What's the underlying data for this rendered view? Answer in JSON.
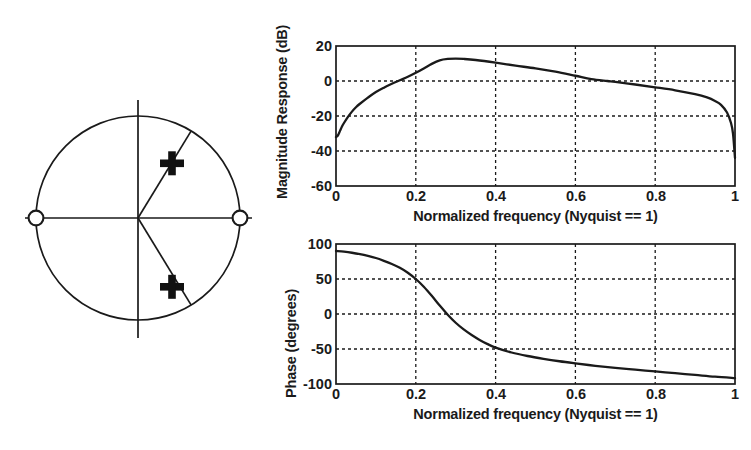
{
  "figure": {
    "panels": [
      "pole-zero-plot",
      "magnitude-response-plot",
      "phase-response-plot"
    ]
  },
  "pole_zero": {
    "unit_circle_label": "unit-circle",
    "zeros_marker": "open-circle",
    "poles_marker": "plus-cross",
    "zeros": [
      {
        "re": -1.0,
        "im": 0.0
      },
      {
        "re": 1.0,
        "im": 0.0
      }
    ],
    "poles": [
      {
        "re": 0.33,
        "im": 0.54,
        "radius": 0.63,
        "angle_deg": 58.5
      },
      {
        "re": 0.33,
        "im": -0.54,
        "radius": 0.63,
        "angle_deg": -58.5
      }
    ]
  },
  "chart_data": [
    {
      "type": "line",
      "name": "magnitude-response",
      "title": "",
      "xlabel": "Normalized frequency (Nyquist == 1)",
      "ylabel": "Magnitude Response (dB)",
      "xlim": [
        0,
        1
      ],
      "ylim": [
        -60,
        20
      ],
      "xticks": [
        0,
        0.2,
        0.4,
        0.6,
        0.8,
        1
      ],
      "xtick_labels": [
        "0",
        "0.2",
        "0.4",
        "0.6",
        "0.8",
        "1"
      ],
      "yticks": [
        -60,
        -40,
        -20,
        0,
        20
      ],
      "ytick_labels": [
        "-60",
        "-40",
        "-20",
        "0",
        "20"
      ],
      "grid": true,
      "grid_style": "dotted",
      "x": [
        0.0,
        0.005,
        0.01,
        0.015,
        0.02,
        0.03,
        0.04,
        0.05,
        0.06,
        0.08,
        0.1,
        0.12,
        0.14,
        0.16,
        0.18,
        0.2,
        0.22,
        0.24,
        0.26,
        0.28,
        0.3,
        0.32,
        0.35,
        0.4,
        0.45,
        0.5,
        0.55,
        0.6,
        0.64,
        0.68,
        0.7,
        0.75,
        0.8,
        0.85,
        0.9,
        0.93,
        0.95,
        0.965,
        0.98,
        0.99,
        0.995,
        1.0
      ],
      "values": [
        -32.0,
        -31.0,
        -28.5,
        -26.0,
        -24.0,
        -20.5,
        -17.5,
        -15.0,
        -13.0,
        -9.5,
        -6.3,
        -3.8,
        -1.6,
        0.4,
        2.4,
        4.7,
        7.2,
        9.8,
        11.8,
        12.6,
        12.8,
        12.6,
        12.0,
        10.5,
        8.8,
        7.2,
        5.3,
        3.0,
        1.1,
        0.0,
        -0.5,
        -2.0,
        -3.6,
        -5.3,
        -7.5,
        -9.4,
        -11.4,
        -13.6,
        -18.0,
        -24.0,
        -30.0,
        -44.0
      ],
      "annotations": [
        {
          "text": "peak ~12.8 dB near f=0.29"
        },
        {
          "text": "deep null at f=1 (zero on unit circle)"
        },
        {
          "text": "low-frequency null at f=0 (zero on unit circle)"
        }
      ]
    },
    {
      "type": "line",
      "name": "phase-response",
      "title": "",
      "xlabel": "Normalized frequency (Nyquist == 1)",
      "ylabel": "Phase (degrees)",
      "xlim": [
        0,
        1
      ],
      "ylim": [
        -100,
        100
      ],
      "xticks": [
        0,
        0.2,
        0.4,
        0.6,
        0.8,
        1
      ],
      "xtick_labels": [
        "0",
        "0.2",
        "0.4",
        "0.6",
        "0.8",
        "1"
      ],
      "yticks": [
        -100,
        -50,
        0,
        50,
        100
      ],
      "ytick_labels": [
        "-100",
        "-50",
        "0",
        "50",
        "100"
      ],
      "grid": true,
      "grid_style": "dotted",
      "x": [
        0.0,
        0.02,
        0.04,
        0.06,
        0.08,
        0.1,
        0.12,
        0.14,
        0.16,
        0.18,
        0.2,
        0.22,
        0.24,
        0.26,
        0.28,
        0.3,
        0.32,
        0.34,
        0.36,
        0.38,
        0.4,
        0.44,
        0.48,
        0.52,
        0.56,
        0.6,
        0.65,
        0.7,
        0.75,
        0.8,
        0.85,
        0.9,
        0.95,
        1.0
      ],
      "values": [
        90.0,
        89.0,
        87.5,
        85.5,
        83.0,
        80.0,
        76.0,
        71.5,
        66.0,
        59.0,
        50.0,
        39.0,
        26.0,
        12.0,
        -1.0,
        -12.5,
        -22.0,
        -30.0,
        -37.0,
        -43.0,
        -48.0,
        -55.0,
        -60.0,
        -64.0,
        -67.5,
        -70.5,
        -74.0,
        -77.0,
        -79.5,
        -82.0,
        -84.5,
        -87.0,
        -89.5,
        -91.5
      ],
      "annotations": [
        {
          "text": "starts at +90 deg at f=0"
        },
        {
          "text": "zero crossing near f=0.28"
        },
        {
          "text": "ends near -92 deg at f=1"
        }
      ]
    }
  ]
}
